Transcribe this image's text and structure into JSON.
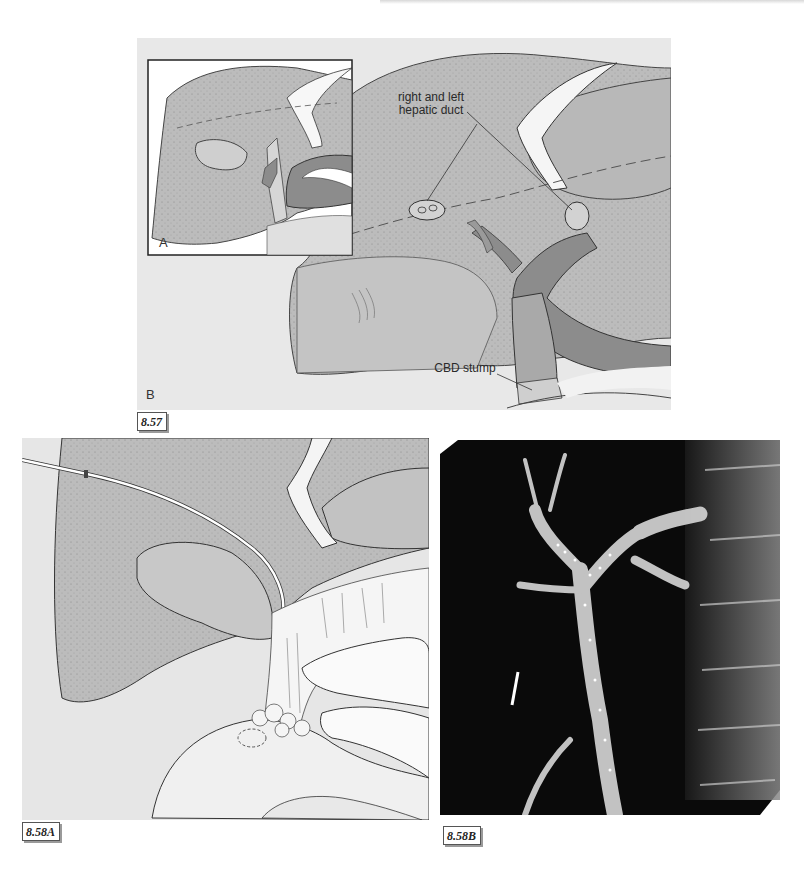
{
  "figures": [
    {
      "id": "8.57",
      "label": "8.57",
      "type": "illustration",
      "panels": {
        "inset": "A",
        "main": "B"
      },
      "annotations": {
        "hepatic_duct": "right and left\nhepatic duct",
        "hepatic_duct_line1": "right and left",
        "hepatic_duct_line2": "hepatic duct",
        "cbd_stump": "CBD stump"
      }
    },
    {
      "id": "8.58A",
      "label": "8.58A",
      "type": "illustration"
    },
    {
      "id": "8.58B",
      "label": "8.58B",
      "type": "radiograph"
    }
  ],
  "colors": {
    "background_panel": "#e6e6e6",
    "liver_gray": "#bdbdbd",
    "duct_dark": "#8a8a8a",
    "duct_mid": "#a8a8a8",
    "xray_black": "#0a0a0a"
  }
}
